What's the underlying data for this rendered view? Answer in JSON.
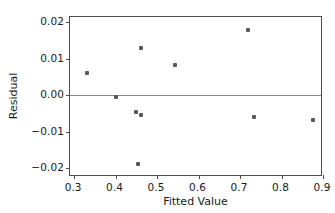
{
  "chart_data": {
    "type": "scatter",
    "title": "",
    "xlabel": "Fitted Value",
    "ylabel": "Residual",
    "xlim": [
      0.29,
      0.9
    ],
    "ylim": [
      -0.0225,
      0.0215
    ],
    "xticks": [
      0.3,
      0.4,
      0.5,
      0.6,
      0.7,
      0.8,
      0.9
    ],
    "xticklabels": [
      "0.3",
      "0.4",
      "0.5",
      "0.6",
      "0.7",
      "0.8",
      "0.9"
    ],
    "yticks": [
      0.02,
      0.01,
      0.0,
      -0.01,
      -0.02
    ],
    "yticklabels": [
      "0.02",
      "0.01",
      "0.00",
      "−0.01",
      "−0.02"
    ],
    "grid": false,
    "legend": null,
    "reference_lines": [
      {
        "axis": "y",
        "value": 0.0,
        "color": "#888888"
      }
    ],
    "marker_color": "#5a5a5a",
    "points": [
      {
        "x": 0.33,
        "y": 0.0061
      },
      {
        "x": 0.402,
        "y": -0.0005
      },
      {
        "x": 0.45,
        "y": -0.0045
      },
      {
        "x": 0.46,
        "y": -0.0055
      },
      {
        "x": 0.455,
        "y": -0.019
      },
      {
        "x": 0.462,
        "y": 0.013
      },
      {
        "x": 0.543,
        "y": 0.0082
      },
      {
        "x": 0.72,
        "y": 0.018
      },
      {
        "x": 0.733,
        "y": -0.0061
      },
      {
        "x": 0.877,
        "y": -0.0067
      }
    ]
  }
}
